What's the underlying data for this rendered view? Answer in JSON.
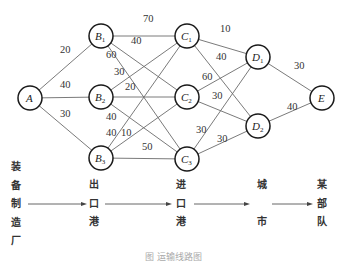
{
  "diagram": {
    "type": "weighted-network",
    "nodes": [
      {
        "id": "A",
        "label": "A",
        "sub": "",
        "x": 30,
        "y": 98
      },
      {
        "id": "B1",
        "label": "B",
        "sub": "1",
        "x": 101,
        "y": 36
      },
      {
        "id": "B2",
        "label": "B",
        "sub": "2",
        "x": 101,
        "y": 97
      },
      {
        "id": "B3",
        "label": "B",
        "sub": "3",
        "x": 101,
        "y": 158
      },
      {
        "id": "C1",
        "label": "C",
        "sub": "1",
        "x": 187,
        "y": 36
      },
      {
        "id": "C2",
        "label": "C",
        "sub": "2",
        "x": 187,
        "y": 97
      },
      {
        "id": "C3",
        "label": "C",
        "sub": "3",
        "x": 187,
        "y": 159
      },
      {
        "id": "D1",
        "label": "D",
        "sub": "1",
        "x": 258,
        "y": 57
      },
      {
        "id": "D2",
        "label": "D",
        "sub": "2",
        "x": 258,
        "y": 126
      },
      {
        "id": "E",
        "label": "E",
        "sub": "",
        "x": 322,
        "y": 98
      }
    ],
    "edges": [
      {
        "from": "A",
        "to": "B1",
        "weight": "20",
        "lx": 60,
        "ly": 53
      },
      {
        "from": "A",
        "to": "B2",
        "weight": "40",
        "lx": 60,
        "ly": 88
      },
      {
        "from": "A",
        "to": "B3",
        "weight": "30",
        "lx": 60,
        "ly": 117
      },
      {
        "from": "B1",
        "to": "C1",
        "weight": "70",
        "lx": 143,
        "ly": 22
      },
      {
        "from": "B1",
        "to": "C2",
        "weight": "40",
        "lx": 131,
        "ly": 44
      },
      {
        "from": "B1",
        "to": "C3",
        "weight": "60",
        "lx": 106,
        "ly": 58
      },
      {
        "from": "B2",
        "to": "C1",
        "weight": "30",
        "lx": 114,
        "ly": 75
      },
      {
        "from": "B2",
        "to": "C2",
        "weight": "20",
        "lx": 125,
        "ly": 90
      },
      {
        "from": "B2",
        "to": "C3",
        "weight": "40",
        "lx": 106,
        "ly": 120
      },
      {
        "from": "B3",
        "to": "C1",
        "weight": "40",
        "lx": 106,
        "ly": 136
      },
      {
        "from": "B3",
        "to": "C2",
        "weight": "10",
        "lx": 121,
        "ly": 136
      },
      {
        "from": "B3",
        "to": "C3",
        "weight": "50",
        "lx": 142,
        "ly": 150
      },
      {
        "from": "C1",
        "to": "D1",
        "weight": "10",
        "lx": 220,
        "ly": 32
      },
      {
        "from": "C1",
        "to": "D2",
        "weight": "40",
        "lx": 216,
        "ly": 60
      },
      {
        "from": "C2",
        "to": "D1",
        "weight": "60",
        "lx": 202,
        "ly": 80
      },
      {
        "from": "C2",
        "to": "D2",
        "weight": "30",
        "lx": 212,
        "ly": 99
      },
      {
        "from": "C3",
        "to": "D1",
        "weight": "30",
        "lx": 196,
        "ly": 133
      },
      {
        "from": "C3",
        "to": "D2",
        "weight": "30",
        "lx": 217,
        "ly": 142
      },
      {
        "from": "D1",
        "to": "E",
        "weight": "30",
        "lx": 294,
        "ly": 69
      },
      {
        "from": "D2",
        "to": "E",
        "weight": "40",
        "lx": 287,
        "ly": 110
      }
    ]
  },
  "stages": [
    {
      "id": "factory",
      "chars": [
        "装",
        "备",
        "制",
        "造",
        "厂"
      ],
      "x": 17,
      "top": 158
    },
    {
      "id": "export-port",
      "chars": [
        "出",
        "口",
        "港"
      ],
      "x": 95,
      "top": 176
    },
    {
      "id": "import-port",
      "chars": [
        "进",
        "口",
        "港"
      ],
      "x": 182,
      "top": 176
    },
    {
      "id": "city",
      "chars": [
        "城",
        "",
        "市"
      ],
      "x": 263,
      "top": 176
    },
    {
      "id": "unit",
      "chars": [
        "某",
        "部",
        "队"
      ],
      "x": 323,
      "top": 176
    }
  ],
  "stage_labels": {
    "factory": "装备制造厂",
    "export_port": "出口港",
    "import_port": "进口港",
    "city": "城市",
    "unit": "某部队"
  },
  "flow_arrows": [
    {
      "x1": 28,
      "x2": 87,
      "y": 204
    },
    {
      "x1": 105,
      "x2": 172,
      "y": 204
    },
    {
      "x1": 194,
      "x2": 250,
      "y": 204
    },
    {
      "x1": 272,
      "x2": 313,
      "y": 204
    }
  ],
  "caption": "图 运输线路图"
}
